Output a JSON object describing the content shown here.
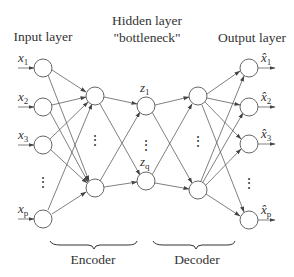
{
  "diagram": {
    "type": "autoencoder-neural-network",
    "labels": {
      "input_layer": "Input layer",
      "hidden_layer_line1": "Hidden layer",
      "hidden_layer_line2": "\"bottleneck\"",
      "output_layer": "Output layer",
      "encoder": "Encoder",
      "decoder": "Decoder"
    },
    "input_nodes": [
      {
        "var": "x",
        "sub": "1"
      },
      {
        "var": "x",
        "sub": "2"
      },
      {
        "var": "x",
        "sub": "3"
      },
      {
        "var": "x",
        "sub": "p"
      }
    ],
    "bottleneck_nodes": [
      {
        "var": "z",
        "sub": "1"
      },
      {
        "var": "z",
        "sub": "q"
      }
    ],
    "output_nodes": [
      {
        "var": "x̂",
        "sub": "1"
      },
      {
        "var": "x̂",
        "sub": "2"
      },
      {
        "var": "x̂",
        "sub": "3"
      },
      {
        "var": "x̂",
        "sub": "p"
      }
    ],
    "ellipsis": "⋮",
    "colors": {
      "stroke": "#555555",
      "text": "#333333",
      "background": "#ffffff"
    }
  }
}
